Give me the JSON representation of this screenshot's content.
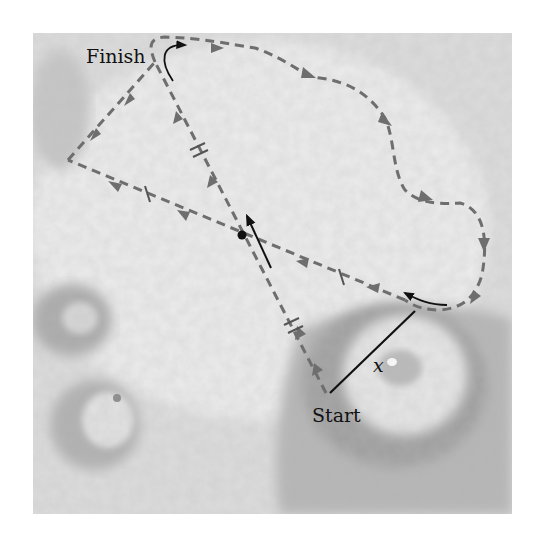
{
  "figure": {
    "labels": {
      "finish": "Finish",
      "start": "Start",
      "displacement": "x"
    },
    "colors": {
      "background": "#ffffff",
      "photo_base": "#d4d4d4",
      "path_dashed": "#6e6e6e",
      "arrow_solid": "#111111",
      "crater_shadow": "#a9a9a9"
    },
    "elements": {
      "path": "dashed route from Start to Finish around terrain with direction arrowheads",
      "equal_length_marks_single": 2,
      "equal_length_marks_double": 2,
      "midpoint_dot": "intersection point of the two diagonals",
      "velocity_arrow": "short solid arrow at the intersection point",
      "displacement_line": "solid line labeled x from Start to rim of crater"
    }
  }
}
